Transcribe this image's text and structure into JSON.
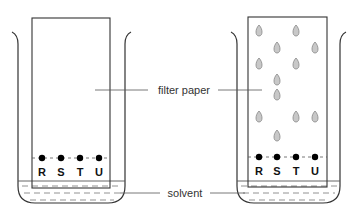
{
  "diagram": {
    "type": "paper-chromatography-setup",
    "labels": {
      "filter_paper": "filter paper",
      "solvent": "solvent"
    },
    "sample_letters": [
      "R",
      "S",
      "T",
      "U"
    ],
    "before": {
      "description": "start: four spots on baseline, no separation",
      "baseline_spots": [
        "R",
        "S",
        "T",
        "U"
      ]
    },
    "after": {
      "description": "developed chromatogram: separated spots above baseline",
      "baseline_spots": [
        "R",
        "S",
        "T",
        "U"
      ],
      "separated_spots": {
        "R": [
          31,
          64,
          117
        ],
        "S": [
          48,
          80,
          95,
          136
        ],
        "T": [
          31,
          64,
          117
        ],
        "U": [
          48,
          117
        ]
      }
    },
    "colors": {
      "line": "#333333",
      "spot_fill": "#c8c8c8",
      "spot_stroke": "#888888",
      "baseline_dot": "#000000"
    }
  }
}
